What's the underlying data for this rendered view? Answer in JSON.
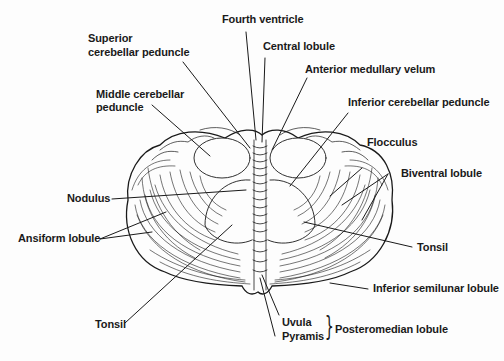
{
  "figure": {
    "labels": {
      "fourth_ventricle": "Fourth ventricle",
      "superior_peduncle_l1": "Superior",
      "superior_peduncle_l2": "cerebellar peduncle",
      "central_lobule": "Central lobule",
      "anterior_medullary_velum": "Anterior medullary velum",
      "middle_peduncle_l1": "Middle cerebellar",
      "middle_peduncle_l2": "peduncle",
      "inferior_peduncle": "Inferior cerebellar peduncle",
      "flocculus": "Flocculus",
      "nodulus": "Nodulus",
      "biventral_lobule": "Biventral lobule",
      "ansiform_lobule": "Ansiform lobule",
      "tonsil_right": "Tonsil",
      "inferior_semilunar_lobule": "Inferior semilunar lobule",
      "tonsil_left": "Tonsil",
      "uvula": "Uvula",
      "pyramis": "Pyramis",
      "posteromedian_lobule": "Posteromedian lobule",
      "brace": "}"
    },
    "colors": {
      "ink": "#1a1a1a",
      "background": "#fdfdfd"
    }
  }
}
